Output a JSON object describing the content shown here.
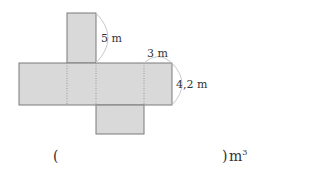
{
  "diagram": {
    "type": "cuboid net",
    "labels": {
      "height": "5 m",
      "width": "3 m",
      "depth": "4,2 m"
    },
    "colors": {
      "face_fill": "#d9d9d9",
      "face_stroke": "#7a7a7a",
      "arc": "#c8c8c8"
    }
  },
  "answer": {
    "open_paren": "(",
    "close_paren": ")",
    "unit": "m",
    "unit_exponent": "3"
  }
}
